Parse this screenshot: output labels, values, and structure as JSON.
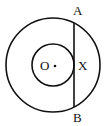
{
  "diagram": {
    "type": "geometry",
    "colors": {
      "stroke": "#111111",
      "background": "#ffffff"
    },
    "center": {
      "label": "O",
      "x": 53,
      "y": 65
    },
    "outer_circle": {
      "cx": 53,
      "cy": 65,
      "r": 47
    },
    "inner_circle": {
      "cx": 53,
      "cy": 65,
      "r": 21
    },
    "chord": {
      "from": "A",
      "to": "B",
      "x": 74,
      "y1": 23,
      "y2": 107
    },
    "labels": {
      "A": "A",
      "B": "B",
      "X": "X",
      "O": "O"
    }
  }
}
